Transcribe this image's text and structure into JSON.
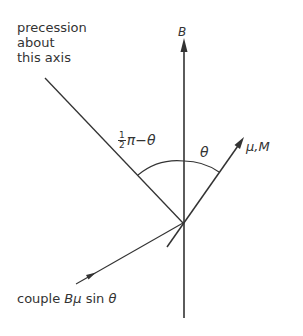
{
  "labels": {
    "precession_line1": "precession",
    "precession_line2": "about",
    "precession_line3": "this axis",
    "B_field": "B",
    "half_num": "1",
    "half_den": "2",
    "angle_complement_rest": "π−θ",
    "theta": "θ",
    "mu_M": "μ,M",
    "couple_prefix": "couple",
    "couple_expr": "Bμ",
    "couple_sin": "sin",
    "couple_theta": "θ"
  },
  "colors": {
    "line": "#333333",
    "text": "#333333",
    "background": "#ffffff"
  }
}
